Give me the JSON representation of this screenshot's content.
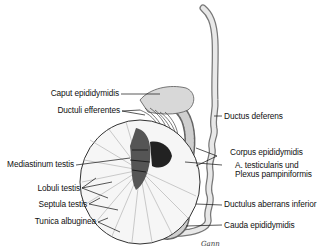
{
  "figure": {
    "signature": "Gann"
  },
  "labels_left": [
    {
      "text": "Caput epididymidis"
    },
    {
      "text": "Ductuli efferentes"
    },
    {
      "text": "Mediastinum testis"
    },
    {
      "text": "Lobuli testis"
    },
    {
      "text": "Septula testis"
    },
    {
      "text": "Tunica albuginea"
    }
  ],
  "labels_right": [
    {
      "text": "Ductus deferens"
    },
    {
      "text": "Corpus epididymidis"
    },
    {
      "text": "A. testicularis und"
    },
    {
      "text": "Plexus pampiniformis"
    },
    {
      "text": "Ductulus aberrans inferior"
    },
    {
      "text": "Cauda epididymidis"
    }
  ]
}
